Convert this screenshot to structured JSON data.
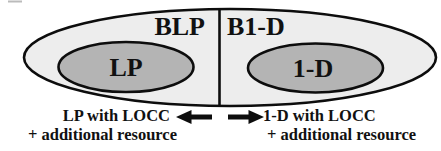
{
  "figure": {
    "regions": {
      "left_label": "BLP",
      "right_label": "B1-D"
    },
    "inner_sets": {
      "left_label": "LP",
      "right_label": "1-D"
    },
    "captions": {
      "left_line1": "LP with LOCC",
      "left_line2": "+ additional resource",
      "right_line1": "1-D with LOCC",
      "right_line2": "+ additional resource"
    }
  },
  "colors": {
    "outer_ellipse_fill": "#ededed",
    "inner_ellipse_fill": "#b4b4b4",
    "outline": "#0d0d0d",
    "text": "#111111",
    "background": "#ffffff"
  }
}
